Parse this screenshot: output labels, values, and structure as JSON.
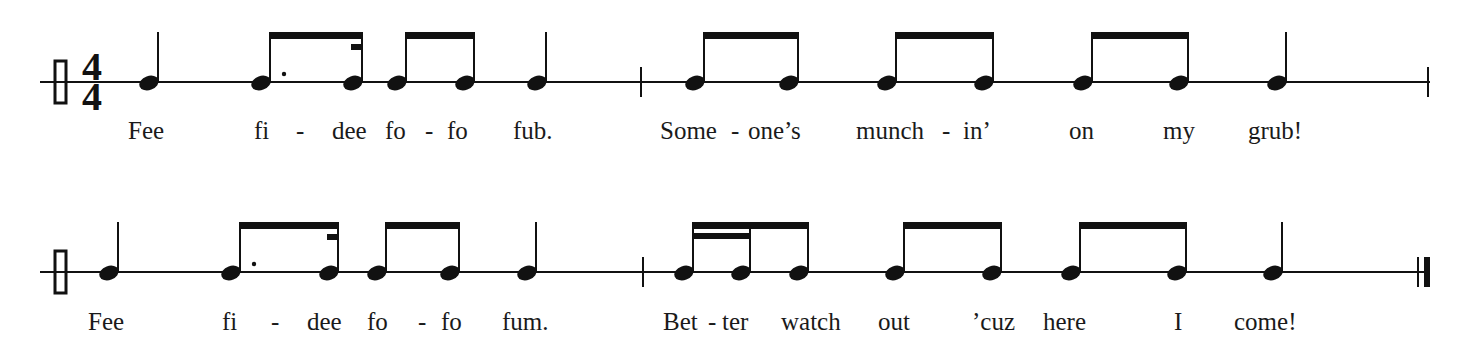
{
  "ink_color": "#111111",
  "time_signature": {
    "top": "4",
    "bottom": "4"
  },
  "systems": [
    {
      "staff_y": 82,
      "staff_x": [
        40,
        1430
      ],
      "clef_x": 61,
      "show_time_signature": true,
      "barlines": [
        {
          "x": 641,
          "type": "single"
        },
        {
          "x": 1428,
          "type": "single"
        }
      ],
      "notes": [
        {
          "x": 150,
          "dur": "quarter"
        },
        {
          "x": 262,
          "dur": "dotted-eighth",
          "group": "g1"
        },
        {
          "x": 354,
          "dur": "sixteenth",
          "group": "g1",
          "partial": "left"
        },
        {
          "x": 398,
          "dur": "eighth",
          "group": "g2"
        },
        {
          "x": 466,
          "dur": "eighth",
          "group": "g2"
        },
        {
          "x": 538,
          "dur": "quarter"
        },
        {
          "x": 696,
          "dur": "eighth",
          "group": "g3"
        },
        {
          "x": 790,
          "dur": "eighth",
          "group": "g3"
        },
        {
          "x": 888,
          "dur": "eighth",
          "group": "g4"
        },
        {
          "x": 985,
          "dur": "eighth",
          "group": "g4"
        },
        {
          "x": 1084,
          "dur": "eighth",
          "group": "g5"
        },
        {
          "x": 1180,
          "dur": "eighth",
          "group": "g5"
        },
        {
          "x": 1278,
          "dur": "quarter"
        }
      ],
      "lyrics_y": 139,
      "lyrics": [
        {
          "x": 128,
          "text": "Fee"
        },
        {
          "x": 254,
          "text": "fi"
        },
        {
          "x": 296,
          "text": "-"
        },
        {
          "x": 332,
          "text": "dee"
        },
        {
          "x": 385,
          "text": "fo"
        },
        {
          "x": 425,
          "text": "-"
        },
        {
          "x": 447,
          "text": "fo"
        },
        {
          "x": 513,
          "text": "fub."
        },
        {
          "x": 660,
          "text": "Some"
        },
        {
          "x": 731,
          "text": "-"
        },
        {
          "x": 748,
          "text": "one’s"
        },
        {
          "x": 856,
          "text": "munch"
        },
        {
          "x": 942,
          "text": "-"
        },
        {
          "x": 963,
          "text": "in’"
        },
        {
          "x": 1069,
          "text": "on"
        },
        {
          "x": 1163,
          "text": "my"
        },
        {
          "x": 1248,
          "text": "grub!"
        }
      ]
    },
    {
      "staff_y": 272,
      "staff_x": [
        40,
        1428
      ],
      "clef_x": 61,
      "show_time_signature": false,
      "barlines": [
        {
          "x": 643,
          "type": "single"
        },
        {
          "x": 1418,
          "type": "final"
        }
      ],
      "notes": [
        {
          "x": 110,
          "dur": "quarter"
        },
        {
          "x": 232,
          "dur": "dotted-eighth",
          "group": "h1"
        },
        {
          "x": 330,
          "dur": "sixteenth",
          "group": "h1",
          "partial": "left"
        },
        {
          "x": 378,
          "dur": "eighth",
          "group": "h2"
        },
        {
          "x": 451,
          "dur": "eighth",
          "group": "h2"
        },
        {
          "x": 528,
          "dur": "quarter"
        },
        {
          "x": 685,
          "dur": "sixteenth",
          "group": "h3",
          "sixteenth_pair_to": 742
        },
        {
          "x": 742,
          "dur": "sixteenth",
          "group": "h3"
        },
        {
          "x": 800,
          "dur": "eighth",
          "group": "h3"
        },
        {
          "x": 896,
          "dur": "eighth",
          "group": "h4"
        },
        {
          "x": 993,
          "dur": "eighth",
          "group": "h4"
        },
        {
          "x": 1072,
          "dur": "eighth",
          "group": "h5"
        },
        {
          "x": 1178,
          "dur": "eighth",
          "group": "h5"
        },
        {
          "x": 1274,
          "dur": "quarter"
        }
      ],
      "lyrics_y": 330,
      "lyrics": [
        {
          "x": 88,
          "text": "Fee"
        },
        {
          "x": 222,
          "text": "fi"
        },
        {
          "x": 271,
          "text": "-"
        },
        {
          "x": 307,
          "text": "dee"
        },
        {
          "x": 367,
          "text": "fo"
        },
        {
          "x": 418,
          "text": "-"
        },
        {
          "x": 441,
          "text": "fo"
        },
        {
          "x": 502,
          "text": "fum."
        },
        {
          "x": 663,
          "text": "Bet"
        },
        {
          "x": 708,
          "text": "-"
        },
        {
          "x": 722,
          "text": "ter"
        },
        {
          "x": 781,
          "text": "watch"
        },
        {
          "x": 878,
          "text": "out"
        },
        {
          "x": 972,
          "text": "’cuz"
        },
        {
          "x": 1043,
          "text": "here"
        },
        {
          "x": 1174,
          "text": "I"
        },
        {
          "x": 1234,
          "text": "come!"
        }
      ]
    }
  ]
}
